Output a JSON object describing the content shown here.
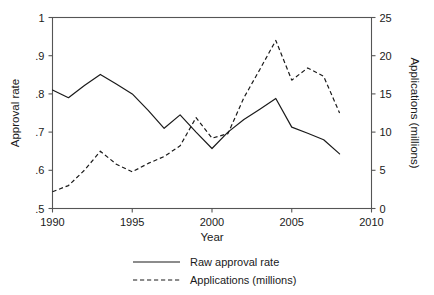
{
  "chart_data": {
    "type": "line",
    "title": "",
    "xlabel": "Year",
    "ylabel": "Approval rate",
    "y2label": "Applications (millions)",
    "xlim": [
      1990,
      2010
    ],
    "ylim": [
      0.5,
      1.0
    ],
    "y2lim": [
      0,
      25
    ],
    "grid": false,
    "legend_position": "bottom",
    "x": [
      1990,
      1991,
      1992,
      1993,
      1994,
      1995,
      1996,
      1997,
      1998,
      1999,
      2000,
      2001,
      2002,
      2003,
      2004,
      2005,
      2006,
      2007,
      2008
    ],
    "xticks": [
      "1990",
      "1995",
      "2000",
      "2005",
      "2010"
    ],
    "xtick_values": [
      1990,
      1995,
      2000,
      2005,
      2010
    ],
    "yticks": [
      ".5",
      ".6",
      ".7",
      ".8",
      ".9",
      "1"
    ],
    "ytick_values": [
      0.5,
      0.6,
      0.7,
      0.8,
      0.9,
      1.0
    ],
    "y2ticks": [
      "0",
      "5",
      "10",
      "15",
      "20",
      "25"
    ],
    "y2tick_values": [
      0,
      5,
      10,
      15,
      20,
      25
    ],
    "series": [
      {
        "name": "Raw approval rate",
        "axis": "left",
        "style": "solid",
        "values": [
          0.81,
          0.79,
          0.822,
          0.851,
          0.826,
          0.8,
          0.757,
          0.71,
          0.745,
          0.7,
          0.657,
          0.7,
          0.733,
          0.76,
          0.788,
          0.713,
          0.697,
          0.68,
          0.643
        ]
      },
      {
        "name": "Applications (millions)",
        "axis": "right",
        "style": "dashed",
        "values": [
          2.2,
          3.0,
          5.0,
          7.5,
          5.8,
          4.8,
          5.9,
          6.8,
          8.2,
          11.9,
          9.2,
          9.8,
          14.5,
          18.2,
          22.0,
          16.8,
          18.4,
          17.3,
          12.5
        ]
      }
    ]
  },
  "legend": {
    "items": [
      {
        "label": "Raw approval rate",
        "style": "solid"
      },
      {
        "label": "Applications (millions)",
        "style": "dashed"
      }
    ]
  }
}
